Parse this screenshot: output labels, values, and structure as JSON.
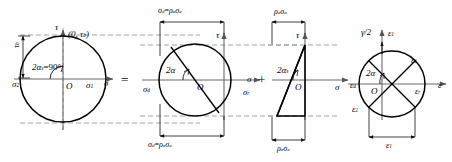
{
  "figure": {
    "operators": {
      "equals": "=",
      "plus": "+"
    },
    "panel1": {
      "name": "stress-mohr-circle",
      "axis_tau": "τ",
      "axis_sigma": "σ",
      "origin": "O",
      "point_label": "(0, τ",
      "point_label_sub": "b",
      "point_label_end": ")",
      "angle_label": "2α",
      "angle_label_sub": "s",
      "angle_label_end": "=90°",
      "left_axis_label": "τ",
      "left_axis_label_sub": "b",
      "sigma2": "σ",
      "sigma2_sub": "2",
      "sigma1": "σ",
      "sigma1_sub": "1"
    },
    "panel2": {
      "name": "deviatoric-mohr-circle",
      "axis_tau": "τ",
      "axis_sigma": "σ",
      "origin": "O",
      "angle_label": "2α",
      "top_dim": "σ",
      "top_dim_sub1": "d",
      "top_dim_eq": "=",
      "top_dim_rho": "ρ",
      "top_dim_sub2": "a",
      "top_dim_sigma": "σ",
      "top_dim_sub3": "a",
      "bottom_dim": "σ",
      "bottom_dim_sub1": "d",
      "bottom_dim_eq": "=",
      "bottom_dim_rho": "ρ",
      "bottom_dim_sub2": "a",
      "bottom_dim_sigma": "σ",
      "bottom_dim_sub3": "a",
      "left_label": "σ",
      "left_label_sub": "d",
      "right_label": "σ",
      "right_label_sub": "r"
    },
    "panel3": {
      "name": "triangular-stress-block",
      "axis_tau": "τ",
      "axis_sigma": "σ",
      "origin": "O",
      "angle_label": "2α",
      "angle_label_sub": "s",
      "top_dim_rho": "ρ",
      "top_dim_sub1": "a",
      "top_dim_sigma": "σ",
      "top_dim_sub2": "a",
      "bottom_dim_rho": "ρ",
      "bottom_dim_sub1": "a",
      "bottom_dim_sigma": "σ",
      "bottom_dim_sub2": "a"
    },
    "panel4": {
      "name": "strain-mohr-circle",
      "axis_gamma": "γ/2",
      "axis_epsilon": "ε",
      "origin": "O",
      "angle_label": "2α",
      "eps_top": "ε",
      "eps_top_sub": "1",
      "eps_right_upper": "ε",
      "eps_right_upper_sub": "1",
      "eps_r": "ε",
      "eps_r_sub": "r",
      "eps_d": "ε",
      "eps_d_sub": "d",
      "eps_2": "ε",
      "eps_2_sub": "2",
      "eps_bottom": "ε",
      "eps_bottom_sub": "1"
    },
    "colors": {
      "stroke": "#000000",
      "axis": "#6b6b6b",
      "dashed": "#8a8a8a",
      "background": "#ffffff"
    }
  }
}
